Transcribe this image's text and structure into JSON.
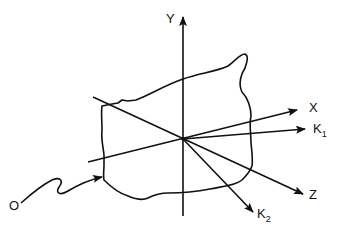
{
  "diagram": {
    "type": "3D coordinate axes with irregular surface",
    "labels": {
      "y_axis": "Y",
      "x_axis": "X",
      "z_axis": "Z",
      "k1_main": "K",
      "k1_sub": "1",
      "k2_main": "K",
      "k2_sub": "2",
      "origin_pointer": "O"
    },
    "colors": {
      "stroke": "#111111",
      "background": "#ffffff"
    }
  }
}
